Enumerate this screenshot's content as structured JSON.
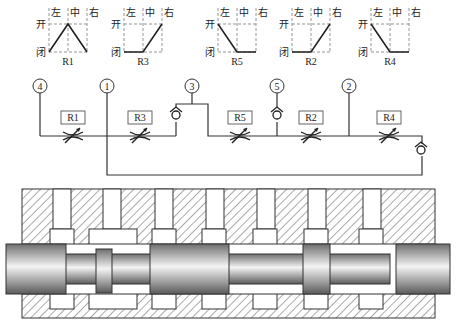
{
  "position_axis": {
    "open_label": "开",
    "closed_label": "闭",
    "left_label": "左",
    "center_label": "中",
    "right_label": "右"
  },
  "valve_charts": [
    {
      "name": "R1",
      "cx": 68,
      "profile": [
        "closed",
        "open",
        "closed"
      ]
    },
    {
      "name": "R3",
      "cx": 143,
      "profile": [
        "closed",
        "closed",
        "open"
      ]
    },
    {
      "name": "R5",
      "cx": 237,
      "profile": [
        "open",
        "closed",
        "closed"
      ]
    },
    {
      "name": "R2",
      "cx": 311,
      "profile": [
        "closed",
        "closed",
        "open"
      ]
    },
    {
      "name": "R4",
      "cx": 390,
      "profile": [
        "open",
        "closed",
        "closed"
      ]
    }
  ],
  "ports": [
    {
      "label": "4",
      "x": 40
    },
    {
      "label": "1",
      "x": 107
    },
    {
      "label": "3",
      "x": 192
    },
    {
      "label": "5",
      "x": 277
    },
    {
      "label": "2",
      "x": 349
    }
  ],
  "restrictors": [
    {
      "label": "R1",
      "x": 73
    },
    {
      "label": "R3",
      "x": 140
    },
    {
      "label": "R5",
      "x": 240
    },
    {
      "label": "R2",
      "x": 311
    },
    {
      "label": "R4",
      "x": 389
    }
  ],
  "check_valves": [
    {
      "name": "check-valve-port3",
      "x": 176,
      "y": 115
    },
    {
      "name": "check-valve-port5",
      "x": 277,
      "y": 115
    },
    {
      "name": "check-valve-return",
      "x": 421,
      "y": 150
    }
  ],
  "colors": {
    "line": "#333333",
    "dash": "#888888",
    "hatch": "#555555",
    "spool_dark": "#6e6e6e",
    "spool_light": "#f4f4f4"
  }
}
